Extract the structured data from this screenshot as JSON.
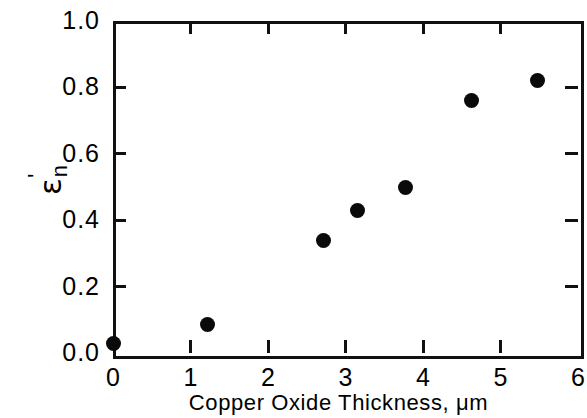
{
  "chart_data": {
    "type": "scatter",
    "title": "",
    "xlabel": "Copper Oxide Thickness, μm",
    "ylabel": "ε'ₙ",
    "ylabel_parts": {
      "symbol": "ε",
      "prime": "'",
      "subscript": "n"
    },
    "xlim": [
      0,
      6
    ],
    "ylim": [
      0.0,
      1.0
    ],
    "xticks": [
      0,
      1,
      2,
      3,
      4,
      5,
      6
    ],
    "yticks": [
      0.0,
      0.2,
      0.4,
      0.6,
      0.8,
      1.0
    ],
    "xtick_labels": [
      "0",
      "1",
      "2",
      "3",
      "4",
      "5",
      "6"
    ],
    "ytick_labels": [
      "0.0",
      "0.2",
      "0.4",
      "0.6",
      "0.8",
      "1.0"
    ],
    "grid": false,
    "legend": null,
    "marker": "filled-circle",
    "marker_color": "#0a0a0a",
    "points": [
      {
        "x": 0.0,
        "y": 0.03
      },
      {
        "x": 1.22,
        "y": 0.085
      },
      {
        "x": 2.72,
        "y": 0.34
      },
      {
        "x": 3.15,
        "y": 0.43
      },
      {
        "x": 3.77,
        "y": 0.5
      },
      {
        "x": 4.63,
        "y": 0.76
      },
      {
        "x": 5.48,
        "y": 0.82
      }
    ],
    "x": [
      0.0,
      1.22,
      2.72,
      3.15,
      3.77,
      4.63,
      5.48
    ],
    "values": [
      0.03,
      0.085,
      0.34,
      0.43,
      0.5,
      0.76,
      0.82
    ]
  },
  "axis_color": "#111111",
  "background": "#ffffff"
}
